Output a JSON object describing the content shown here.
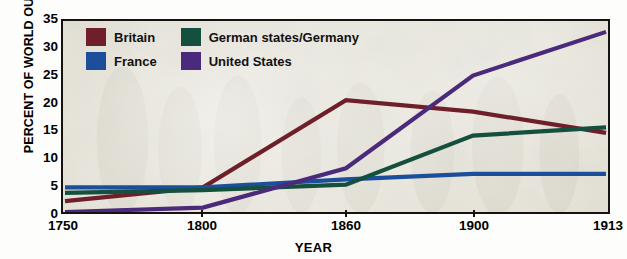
{
  "chart_data": {
    "type": "line",
    "title": "",
    "xlabel": "YEAR",
    "ylabel": "PERCENT OF WORLD OUTPUT",
    "x": [
      1750,
      1800,
      1860,
      1900,
      1913
    ],
    "xtick_labels": [
      "1750",
      "1800",
      "1860",
      "1900",
      "1913"
    ],
    "ytick_labels": [
      "0",
      "5",
      "10",
      "15",
      "20",
      "25",
      "30",
      "35"
    ],
    "ylim": [
      0,
      35
    ],
    "ytick_step": 5,
    "grid": false,
    "legend_position": "top-left",
    "series": [
      {
        "name": "Britain",
        "color": "#6e1f2a",
        "values": [
          2,
          4.5,
          20.5,
          18.4,
          14.5
        ]
      },
      {
        "name": "France",
        "color": "#1b4f9c",
        "values": [
          4.5,
          4.5,
          6,
          7,
          7
        ]
      },
      {
        "name": "German states/Germany",
        "color": "#15503f",
        "values": [
          3.5,
          4,
          5,
          14,
          15.5
        ]
      },
      {
        "name": "United States",
        "color": "#4b2a7b",
        "values": [
          0,
          0.8,
          8,
          25,
          33
        ]
      }
    ]
  },
  "legend": {
    "items": [
      {
        "label": "Britain",
        "color": "#6e1f2a"
      },
      {
        "label": "German states/Germany",
        "color": "#15503f"
      },
      {
        "label": "France",
        "color": "#1b4f9c"
      },
      {
        "label": "United States",
        "color": "#4b2a7b"
      }
    ]
  }
}
